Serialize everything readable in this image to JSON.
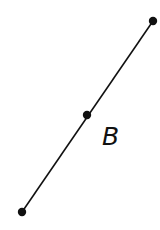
{
  "diagram": {
    "type": "line-with-points",
    "colors": {
      "line": "#111111",
      "point": "#111111",
      "background": "#ffffff"
    },
    "points": [
      {
        "id": "top",
        "x": 153,
        "y": 21
      },
      {
        "id": "middle",
        "x": 87,
        "y": 115
      },
      {
        "id": "bottom",
        "x": 22,
        "y": 212
      }
    ],
    "segment": {
      "from": "bottom",
      "to": "top"
    },
    "label": {
      "text": "B",
      "x": 102,
      "y": 145
    }
  }
}
